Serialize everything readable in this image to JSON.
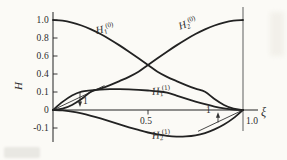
{
  "figure_title": "Hermite interpolation shape functions",
  "chart_data": {
    "type": "line",
    "title": "",
    "xlabel": "ξ",
    "ylabel": "H",
    "x_range": [
      0,
      1
    ],
    "y_scale_note": "non-uniform axis: tick values -0.1, 0, 0.1, 0.4, 0.6, 0.8, 1.0 are equally spaced",
    "grid": false,
    "legend": "inline curve labels",
    "x_ticks": [
      {
        "value": 0.5,
        "label": "0.5"
      },
      {
        "value": 1.0,
        "label": "1.0"
      }
    ],
    "y_ticks": [
      {
        "value": 1.0,
        "label": "1.0"
      },
      {
        "value": 0.8,
        "label": "0.8"
      },
      {
        "value": 0.6,
        "label": "0.6"
      },
      {
        "value": 0.4,
        "label": "0.4"
      },
      {
        "value": 0.1,
        "label": "0.1"
      },
      {
        "value": 0,
        "label": "0"
      },
      {
        "value": -0.1,
        "label": "-0.1"
      }
    ],
    "x": [
      0,
      0.05,
      0.1,
      0.15,
      0.2,
      0.25,
      0.3,
      0.35,
      0.4,
      0.45,
      0.5,
      0.55,
      0.6,
      0.65,
      0.7,
      0.75,
      0.8,
      0.85,
      0.9,
      0.95,
      1
    ],
    "series": [
      {
        "name": "H1^(0)",
        "label": {
          "base": "H",
          "sub": "1",
          "sup": "(0)"
        },
        "values": [
          1,
          0.993,
          0.972,
          0.939,
          0.896,
          0.844,
          0.784,
          0.718,
          0.648,
          0.575,
          0.5,
          0.425,
          0.352,
          0.282,
          0.216,
          0.156,
          0.104,
          0.061,
          0.028,
          0.007,
          0
        ]
      },
      {
        "name": "H2^(0)",
        "label": {
          "base": "H",
          "sub": "2",
          "sup": "(0)"
        },
        "values": [
          0,
          0.007,
          0.028,
          0.061,
          0.104,
          0.156,
          0.216,
          0.282,
          0.352,
          0.425,
          0.5,
          0.575,
          0.648,
          0.718,
          0.784,
          0.844,
          0.896,
          0.939,
          0.972,
          0.993,
          1
        ]
      },
      {
        "name": "H1^(1)",
        "label": {
          "base": "H",
          "sub": "1",
          "sup": "(1)"
        },
        "values": [
          0,
          0.045,
          0.081,
          0.108,
          0.128,
          0.141,
          0.147,
          0.148,
          0.144,
          0.136,
          0.125,
          0.111,
          0.096,
          0.08,
          0.063,
          0.047,
          0.032,
          0.019,
          0.009,
          0.002,
          0
        ]
      },
      {
        "name": "H2^(1)",
        "label": {
          "base": "H",
          "sub": "2",
          "sup": "(1)"
        },
        "values": [
          0,
          -0.002,
          -0.009,
          -0.019,
          -0.032,
          -0.047,
          -0.063,
          -0.08,
          -0.096,
          -0.111,
          -0.125,
          -0.136,
          -0.144,
          -0.148,
          -0.147,
          -0.141,
          -0.128,
          -0.108,
          -0.081,
          -0.045,
          0
        ]
      }
    ],
    "annotations": {
      "boundary_line_xi": 1.0,
      "tangent_lines": [
        {
          "series": "H1^(1)",
          "at_xi": 0,
          "slope": 1
        },
        {
          "series": "H2^(1)",
          "at_xi": 1,
          "slope": 1
        }
      ],
      "slope_markers": [
        {
          "label": "1",
          "position": "near-origin",
          "arrow": "down"
        },
        {
          "label": "1",
          "position": "near-xi-1",
          "arrow": "up"
        }
      ]
    },
    "colors": {
      "curve": "#222222",
      "axis": "#222222",
      "boundary": "#8a8a8a",
      "annotation": "#333333",
      "background": "#fbfaf6"
    }
  }
}
